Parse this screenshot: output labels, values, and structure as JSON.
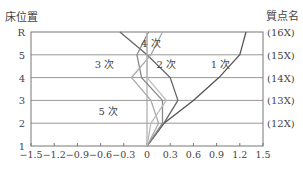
{
  "chart_data": {
    "type": "line",
    "title": "",
    "ylabel": "床位置",
    "right_label": "質点名",
    "xlabel": "",
    "xlim": [
      -1.5,
      1.5
    ],
    "x_ticks": [
      "−1.5",
      "−1.2",
      "−0.9",
      "−0.6",
      "−0.3",
      "0",
      "0.3",
      "0.6",
      "0.9",
      "1.2",
      "1.5"
    ],
    "x_tick_values": [
      -1.5,
      -1.2,
      -0.9,
      -0.6,
      -0.3,
      0,
      0.3,
      0.6,
      0.9,
      1.2,
      1.5
    ],
    "floors": [
      "1",
      "2",
      "3",
      "4",
      "5",
      "R"
    ],
    "mass_names": [
      "(12X)",
      "(13X)",
      "(14X)",
      "(15X)",
      "(16X)"
    ],
    "grid": true,
    "series": [
      {
        "name": "1 次",
        "color": "#555555",
        "values": [
          0,
          0.22,
          0.6,
          0.93,
          1.2,
          1.28
        ]
      },
      {
        "name": "2 次",
        "color": "#666666",
        "values": [
          0,
          0.22,
          0.4,
          0.3,
          0.0,
          -0.35
        ]
      },
      {
        "name": "3 次",
        "color": "#888888",
        "values": [
          0,
          0.2,
          0.2,
          -0.07,
          -0.13,
          0.02
        ]
      },
      {
        "name": "4 次",
        "color": "#aaaaaa",
        "values": [
          0,
          0.15,
          0.05,
          -0.2,
          0.05,
          0.2
        ]
      },
      {
        "name": "5 次",
        "color": "#bbbbbb",
        "values": [
          0,
          0.05,
          0.25,
          0.0,
          0.0,
          0.0
        ]
      }
    ],
    "annotations": [
      {
        "text": "1 次",
        "x": 0.95,
        "floor": 4.6
      },
      {
        "text": "2 次",
        "x": 0.25,
        "floor": 4.6
      },
      {
        "text": "3 次",
        "x": -0.55,
        "floor": 4.6
      },
      {
        "text": "4 次",
        "x": 0.05,
        "floor": 5.5
      },
      {
        "text": "5 次",
        "x": -0.5,
        "floor": 2.55
      }
    ]
  }
}
